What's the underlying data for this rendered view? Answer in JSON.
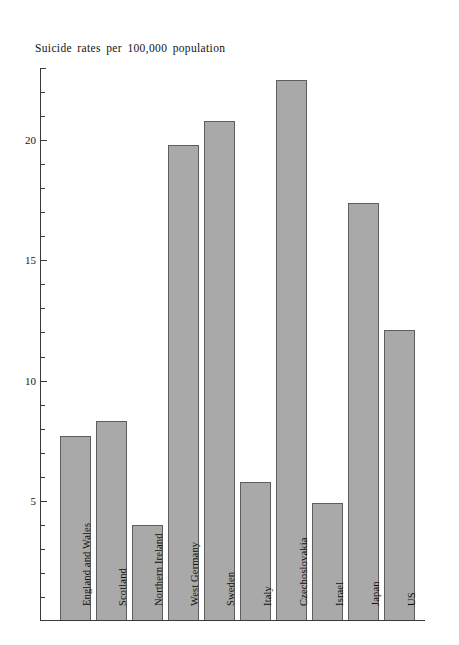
{
  "chart_data": {
    "type": "bar",
    "title": "Suicide rates per 100,000 population",
    "xlabel": "",
    "ylabel": "",
    "ylim": [
      0,
      23
    ],
    "grid": false,
    "legend": null,
    "y_tick_labels": [
      "5",
      "10",
      "15",
      "20"
    ],
    "y_tick_values": [
      5,
      10,
      15,
      20
    ],
    "y_minor_tick_step": 1,
    "categories": [
      "England and Wales",
      "Scotland",
      "Northern Ireland",
      "West Germany",
      "Sweden",
      "Italy",
      "Czechoslovakia",
      "Israel",
      "Japan",
      "US"
    ],
    "values": [
      7.7,
      8.3,
      4.0,
      19.8,
      20.8,
      5.8,
      22.5,
      4.9,
      17.4,
      12.1
    ],
    "bar_fill_color": "#a9a9a9",
    "bar_edge_color": "#5e5e5e",
    "axis_color": "#3a3a3a",
    "background_color": "#ffffff"
  }
}
